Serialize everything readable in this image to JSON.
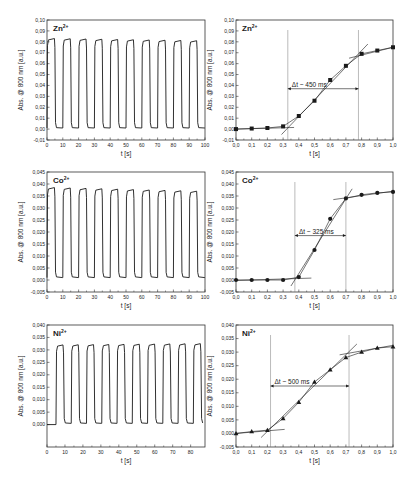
{
  "figure": {
    "colors": {
      "line": "#1a1a1a",
      "frame": "#333333",
      "guide": "#777777",
      "background": "#ffffff"
    },
    "panels": [
      {
        "id": "zn-cycles",
        "label": "Zn",
        "charge": "2+",
        "type": "line",
        "box": [
          47,
          20,
          158,
          120
        ],
        "xlabel": "t [s]",
        "ylabel": "Abs. @ 800 nm [a.u.]",
        "xlim": [
          0,
          100
        ],
        "ylim": [
          -0.01,
          0.1
        ],
        "xticks": [
          0,
          10,
          20,
          30,
          40,
          50,
          60,
          70,
          80,
          90,
          100
        ],
        "xticklabels": [
          "0",
          "10",
          "20",
          "30",
          "40",
          "50",
          "60",
          "70",
          "80",
          "90",
          "100"
        ],
        "yticks": [
          -0.01,
          0.0,
          0.01,
          0.02,
          0.03,
          0.04,
          0.05,
          0.06,
          0.07,
          0.08,
          0.09,
          0.1
        ],
        "yticklabels": [
          "-0,01",
          "0,00",
          "0,01",
          "0,02",
          "0,03",
          "0,04",
          "0,05",
          "0,06",
          "0,07",
          "0,08",
          "0,09",
          "0,10"
        ],
        "cycles": {
          "start": 0,
          "period": 10,
          "on_duration": 5,
          "count": 10,
          "high": 0.083,
          "low": 0.001,
          "high_end": 0.081
        }
      },
      {
        "id": "zn-zoom",
        "label": "Zn",
        "charge": "2+",
        "type": "scatter",
        "box": [
          236,
          20,
          157,
          120
        ],
        "xlabel": "t [s]",
        "ylabel": "Abs. @ 800 nm [a.u.]",
        "xlim": [
          0,
          1.0
        ],
        "ylim": [
          -0.01,
          0.1
        ],
        "xticks": [
          0,
          0.1,
          0.2,
          0.3,
          0.4,
          0.5,
          0.6,
          0.7,
          0.8,
          0.9,
          1.0
        ],
        "xticklabels": [
          "0,0",
          "0,1",
          "0,2",
          "0,3",
          "0,4",
          "0,5",
          "0,6",
          "0,7",
          "0,8",
          "0,9",
          "1,0"
        ],
        "yticks": [
          -0.01,
          0.0,
          0.01,
          0.02,
          0.03,
          0.04,
          0.05,
          0.06,
          0.07,
          0.08,
          0.09,
          0.1
        ],
        "yticklabels": [
          "-0,01",
          "0,00",
          "0,01",
          "0,02",
          "0,03",
          "0,04",
          "0,05",
          "0,06",
          "0,07",
          "0,08",
          "0,09",
          "0,10"
        ],
        "marker": "square",
        "x": [
          0.0,
          0.1,
          0.2,
          0.3,
          0.4,
          0.5,
          0.6,
          0.7,
          0.8,
          0.9,
          1.0
        ],
        "y": [
          0.0,
          0.0005,
          0.001,
          0.0025,
          0.012,
          0.026,
          0.045,
          0.058,
          0.069,
          0.072,
          0.075
        ],
        "fit_lines": [
          [
            [
              0.0,
              0.0
            ],
            [
              0.37,
              0.0015
            ]
          ],
          [
            [
              0.29,
              -0.005
            ],
            [
              0.84,
              0.078
            ]
          ],
          [
            [
              0.72,
              0.065
            ],
            [
              1.0,
              0.075
            ]
          ]
        ],
        "vlines": [
          0.33,
          0.78
        ],
        "delta": {
          "x1": 0.33,
          "x2": 0.78,
          "y": 0.037,
          "text": "Δt ~ 450 ms"
        }
      },
      {
        "id": "co-cycles",
        "label": "Co",
        "charge": "2+",
        "type": "line",
        "box": [
          47,
          172,
          158,
          120
        ],
        "xlabel": "t [s]",
        "ylabel": "Abs. @ 800 nm [a.u.]",
        "xlim": [
          0,
          100
        ],
        "ylim": [
          -0.005,
          0.045
        ],
        "xticks": [
          0,
          10,
          20,
          30,
          40,
          50,
          60,
          70,
          80,
          90,
          100
        ],
        "xticklabels": [
          "0",
          "10",
          "20",
          "30",
          "40",
          "50",
          "60",
          "70",
          "80",
          "90",
          "100"
        ],
        "yticks": [
          -0.005,
          0.0,
          0.005,
          0.01,
          0.015,
          0.02,
          0.025,
          0.03,
          0.035,
          0.04,
          0.045
        ],
        "yticklabels": [
          "-0,005",
          "0,000",
          "0,005",
          "0,010",
          "0,015",
          "0,020",
          "0,025",
          "0,030",
          "0,035",
          "0,040",
          "0,045"
        ],
        "cycles": {
          "start": 0,
          "period": 10,
          "on_duration": 5,
          "count": 10,
          "high": 0.0385,
          "low": 0.001,
          "high_end": 0.037
        }
      },
      {
        "id": "co-zoom",
        "label": "Co",
        "charge": "2+",
        "type": "scatter",
        "box": [
          236,
          172,
          157,
          120
        ],
        "xlabel": "t [s]",
        "ylabel": "Abs. @ 800 nm [a.u.]",
        "xlim": [
          0,
          1.0
        ],
        "ylim": [
          -0.005,
          0.045
        ],
        "xticks": [
          0,
          0.1,
          0.2,
          0.3,
          0.4,
          0.5,
          0.6,
          0.7,
          0.8,
          0.9,
          1.0
        ],
        "xticklabels": [
          "0,0",
          "0,1",
          "0,2",
          "0,3",
          "0,4",
          "0,5",
          "0,6",
          "0,7",
          "0,8",
          "0,9",
          "1,0"
        ],
        "yticks": [
          -0.005,
          0.0,
          0.005,
          0.01,
          0.015,
          0.02,
          0.025,
          0.03,
          0.035,
          0.04,
          0.045
        ],
        "yticklabels": [
          "-0,005",
          "0,000",
          "0,005",
          "0,010",
          "0,015",
          "0,020",
          "0,025",
          "0,030",
          "0,035",
          "0,040",
          "0,045"
        ],
        "marker": "circle",
        "x": [
          0.0,
          0.1,
          0.2,
          0.3,
          0.4,
          0.5,
          0.6,
          0.7,
          0.8,
          0.9,
          1.0
        ],
        "y": [
          0.0,
          0.0,
          0.0,
          0.0,
          0.0012,
          0.0125,
          0.0255,
          0.034,
          0.0355,
          0.0363,
          0.0367
        ],
        "fit_lines": [
          [
            [
              0.0,
              -0.0002
            ],
            [
              0.48,
              0.0008
            ]
          ],
          [
            [
              0.35,
              -0.0025
            ],
            [
              0.74,
              0.038
            ]
          ],
          [
            [
              0.62,
              0.0335
            ],
            [
              1.0,
              0.037
            ]
          ]
        ],
        "vlines": [
          0.375,
          0.7
        ],
        "delta": {
          "x1": 0.375,
          "x2": 0.7,
          "y": 0.0185,
          "text": "Δt ~ 325 ms"
        }
      },
      {
        "id": "ni-cycles",
        "label": "Ni",
        "charge": "2+",
        "type": "line",
        "box": [
          47,
          325,
          158,
          122
        ],
        "xlabel": "t [s]",
        "ylabel": "Abs. @ 800 nm [a.u.]",
        "xlim": [
          0,
          88
        ],
        "ylim": [
          -0.009,
          0.04
        ],
        "xticks": [
          0,
          10,
          20,
          30,
          40,
          50,
          60,
          70,
          80
        ],
        "xticklabels": [
          "0",
          "10",
          "20",
          "30",
          "40",
          "50",
          "60",
          "70",
          "80"
        ],
        "yticks": [
          0.0,
          0.005,
          0.01,
          0.015,
          0.02,
          0.025,
          0.03,
          0.035,
          0.04
        ],
        "yticklabels": [
          "0,000",
          "0,005",
          "0,010",
          "0,015",
          "0,020",
          "0,025",
          "0,030",
          "0,035",
          "0,040"
        ],
        "cycles": {
          "start": 5,
          "period": 8.5,
          "on_duration": 4.2,
          "count": 10,
          "high": 0.032,
          "low": 0.0005,
          "high_end": 0.0325,
          "baseline_before": 0.0
        }
      },
      {
        "id": "ni-zoom",
        "label": "Ni",
        "charge": "2+",
        "type": "scatter",
        "box": [
          236,
          325,
          157,
          122
        ],
        "xlabel": "t [s]",
        "ylabel": "Abs. @ 800 nm [a.u.]",
        "xlim": [
          0,
          1.0
        ],
        "ylim": [
          -0.005,
          0.04
        ],
        "xticks": [
          0,
          0.1,
          0.2,
          0.3,
          0.4,
          0.5,
          0.6,
          0.7,
          0.8,
          0.9,
          1.0
        ],
        "xticklabels": [
          "0,0",
          "0,1",
          "0,2",
          "0,3",
          "0,4",
          "0,5",
          "0,6",
          "0,7",
          "0,8",
          "0,9",
          "1,0"
        ],
        "yticks": [
          -0.005,
          0.0,
          0.005,
          0.01,
          0.015,
          0.02,
          0.025,
          0.03,
          0.035,
          0.04
        ],
        "yticklabels": [
          "-0,005",
          "0,000",
          "0,005",
          "0,010",
          "0,015",
          "0,020",
          "0,025",
          "0,030",
          "0,035",
          "0,040"
        ],
        "marker": "triangle",
        "x": [
          0.0,
          0.1,
          0.2,
          0.3,
          0.4,
          0.5,
          0.6,
          0.7,
          0.8,
          0.9,
          1.0
        ],
        "y": [
          0.0,
          0.0007,
          0.0012,
          0.0055,
          0.0115,
          0.019,
          0.0235,
          0.028,
          0.03,
          0.0315,
          0.032
        ],
        "fit_lines": [
          [
            [
              0.0,
              0.0
            ],
            [
              0.31,
              0.0015
            ]
          ],
          [
            [
              0.16,
              -0.0015
            ],
            [
              0.77,
              0.033
            ]
          ],
          [
            [
              0.66,
              0.029
            ],
            [
              1.0,
              0.0325
            ]
          ]
        ],
        "vlines": [
          0.22,
          0.72
        ],
        "delta": {
          "x1": 0.22,
          "x2": 0.72,
          "y": 0.0175,
          "text": "Δt ~ 500 ms"
        }
      }
    ]
  },
  "chart_data": [
    {
      "type": "line",
      "title": "Zn2+ switching cycles",
      "panel_label": "Zn2+",
      "xlabel": "t [s]",
      "ylabel": "Abs. @ 800 nm [a.u.]",
      "xlim": [
        0,
        100
      ],
      "ylim": [
        -0.01,
        0.1
      ],
      "grid": false,
      "description": "10 square-wave cycles, period ~10 s, high ~0.083 (slightly decaying to ~0.081), low ~0.001"
    },
    {
      "type": "scatter",
      "title": "Zn2+ response time",
      "panel_label": "Zn2+",
      "xlabel": "t [s]",
      "ylabel": "Abs. @ 800 nm [a.u.]",
      "xlim": [
        0,
        1.0
      ],
      "ylim": [
        -0.01,
        0.1
      ],
      "x": [
        0.0,
        0.1,
        0.2,
        0.3,
        0.4,
        0.5,
        0.6,
        0.7,
        0.8,
        0.9,
        1.0
      ],
      "y": [
        0.0,
        0.0005,
        0.001,
        0.0025,
        0.012,
        0.026,
        0.045,
        0.058,
        0.069,
        0.072,
        0.075
      ],
      "annotations": [
        "Δt ~ 450 ms"
      ],
      "vlines": [
        0.33,
        0.78
      ]
    },
    {
      "type": "line",
      "title": "Co2+ switching cycles",
      "panel_label": "Co2+",
      "xlabel": "t [s]",
      "ylabel": "Abs. @ 800 nm [a.u.]",
      "xlim": [
        0,
        100
      ],
      "ylim": [
        -0.005,
        0.045
      ],
      "grid": false,
      "description": "10 square-wave cycles, period ~10 s, high ~0.0385 (decaying to ~0.037), low ~0.001"
    },
    {
      "type": "scatter",
      "title": "Co2+ response time",
      "panel_label": "Co2+",
      "xlabel": "t [s]",
      "ylabel": "Abs. @ 800 nm [a.u.]",
      "xlim": [
        0,
        1.0
      ],
      "ylim": [
        -0.005,
        0.045
      ],
      "x": [
        0.0,
        0.1,
        0.2,
        0.3,
        0.4,
        0.5,
        0.6,
        0.7,
        0.8,
        0.9,
        1.0
      ],
      "y": [
        0.0,
        0.0,
        0.0,
        0.0,
        0.0012,
        0.0125,
        0.0255,
        0.034,
        0.0355,
        0.0363,
        0.0367
      ],
      "annotations": [
        "Δt ~ 325 ms"
      ],
      "vlines": [
        0.375,
        0.7
      ]
    },
    {
      "type": "line",
      "title": "Ni2+ switching cycles",
      "panel_label": "Ni2+",
      "xlabel": "t [s]",
      "ylabel": "Abs. @ 800 nm [a.u.]",
      "xlim": [
        0,
        88
      ],
      "ylim": [
        -0.009,
        0.04
      ],
      "grid": false,
      "description": "10 square-wave cycles starting at ~5 s, period ~8.5 s, high ~0.032, low ~0.0005"
    },
    {
      "type": "scatter",
      "title": "Ni2+ response time",
      "panel_label": "Ni2+",
      "xlabel": "t [s]",
      "ylabel": "Abs. @ 800 nm [a.u.]",
      "xlim": [
        0,
        1.0
      ],
      "ylim": [
        -0.005,
        0.04
      ],
      "x": [
        0.0,
        0.1,
        0.2,
        0.3,
        0.4,
        0.5,
        0.6,
        0.7,
        0.8,
        0.9,
        1.0
      ],
      "y": [
        0.0,
        0.0007,
        0.0012,
        0.0055,
        0.0115,
        0.019,
        0.0235,
        0.028,
        0.03,
        0.0315,
        0.032
      ],
      "annotations": [
        "Δt ~ 500 ms"
      ],
      "vlines": [
        0.22,
        0.72
      ]
    }
  ]
}
